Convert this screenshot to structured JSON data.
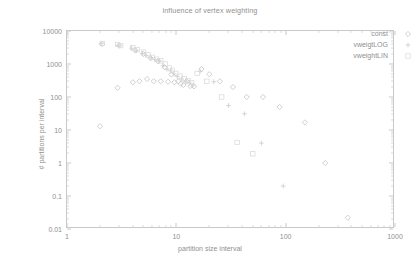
{
  "chart_data": {
    "type": "scatter",
    "title": "influence of vertex weighting",
    "xlabel": "partition size interval",
    "ylabel": "# partitions per interval",
    "xscale": "log",
    "yscale": "log",
    "xlim": [
      1,
      1000
    ],
    "ylim": [
      0.01,
      10000
    ],
    "xticks": [
      "1",
      "10",
      "100",
      "1000"
    ],
    "xtick_values": [
      1,
      10,
      100,
      1000
    ],
    "yticks": [
      "0.01",
      "0.1",
      "1",
      "10",
      "100",
      "1000",
      "10000"
    ],
    "ytick_values": [
      0.01,
      0.1,
      1,
      10,
      100,
      1000,
      10000
    ],
    "grid": false,
    "legend_position": "top-right",
    "series": [
      {
        "name": "const",
        "marker": "diamond",
        "points": [
          [
            2.0,
            13
          ],
          [
            2.1,
            4000
          ],
          [
            2.9,
            190
          ],
          [
            3.0,
            3600
          ],
          [
            4.0,
            280
          ],
          [
            4.2,
            2600
          ],
          [
            4.6,
            300
          ],
          [
            5.0,
            2000
          ],
          [
            5.4,
            350
          ],
          [
            5.8,
            1500
          ],
          [
            6.2,
            300
          ],
          [
            6.8,
            1200
          ],
          [
            7.2,
            300
          ],
          [
            7.8,
            800
          ],
          [
            8.4,
            290
          ],
          [
            9.0,
            480
          ],
          [
            9.6,
            280
          ],
          [
            10.4,
            300
          ],
          [
            11.0,
            250
          ],
          [
            11.6,
            230
          ],
          [
            12.4,
            300
          ],
          [
            13.4,
            215
          ],
          [
            14.5,
            210
          ],
          [
            17.0,
            700
          ],
          [
            20.0,
            490
          ],
          [
            25.0,
            300
          ],
          [
            33.0,
            200
          ],
          [
            44.0,
            100
          ],
          [
            62.0,
            100
          ],
          [
            88.0,
            50
          ],
          [
            150.0,
            17
          ],
          [
            230.0,
            1.0
          ],
          [
            370.0,
            0.022
          ]
        ]
      },
      {
        "name": "vweigtLOG",
        "marker": "plus",
        "points": [
          [
            2.05,
            4100
          ],
          [
            2.95,
            3700
          ],
          [
            3.9,
            3000
          ],
          [
            4.3,
            2500
          ],
          [
            4.9,
            2100
          ],
          [
            5.3,
            1800
          ],
          [
            5.9,
            1550
          ],
          [
            6.4,
            1350
          ],
          [
            7.0,
            1250
          ],
          [
            7.6,
            900
          ],
          [
            8.2,
            700
          ],
          [
            8.9,
            620
          ],
          [
            9.5,
            500
          ],
          [
            10.2,
            420
          ],
          [
            11.2,
            350
          ],
          [
            12.2,
            300
          ],
          [
            13.2,
            265
          ],
          [
            14.2,
            230
          ],
          [
            16.5,
            600
          ],
          [
            22.0,
            290
          ],
          [
            30.0,
            55
          ],
          [
            42.0,
            31
          ],
          [
            60.0,
            4.0
          ],
          [
            95.0,
            0.2
          ]
        ]
      },
      {
        "name": "vweightLIN",
        "marker": "square",
        "points": [
          [
            2.1,
            4200
          ],
          [
            2.9,
            3900
          ],
          [
            3.1,
            3600
          ],
          [
            4.0,
            3100
          ],
          [
            4.4,
            2700
          ],
          [
            5.0,
            2300
          ],
          [
            5.5,
            1900
          ],
          [
            6.0,
            1600
          ],
          [
            6.6,
            1400
          ],
          [
            7.2,
            1250
          ],
          [
            7.9,
            1000
          ],
          [
            8.6,
            760
          ],
          [
            9.2,
            640
          ],
          [
            9.9,
            520
          ],
          [
            10.8,
            430
          ],
          [
            11.8,
            360
          ],
          [
            12.8,
            310
          ],
          [
            13.8,
            270
          ],
          [
            15.5,
            520
          ],
          [
            19.0,
            300
          ],
          [
            26.0,
            100
          ],
          [
            36.0,
            4.2
          ],
          [
            50.0,
            1.9
          ]
        ]
      }
    ]
  },
  "legend": {
    "entries": [
      {
        "label": "const",
        "marker": "diamond"
      },
      {
        "label": "vweigtLOG",
        "marker": "plus"
      },
      {
        "label": "vweightLIN",
        "marker": "square"
      }
    ]
  }
}
